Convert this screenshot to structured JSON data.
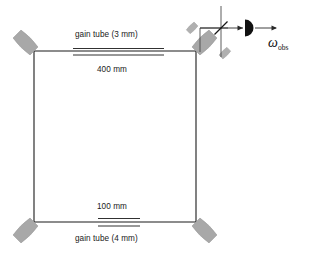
{
  "figure": {
    "type": "ring-laser-gyroscope-schematic",
    "cavity": {
      "shape": "square",
      "top_arm_length": "400 mm",
      "bottom_arm_length": "100 mm"
    },
    "labels": {
      "gain_tube_top": "gain tube (3 mm)",
      "length_top": "400 mm",
      "length_bottom": "100 mm",
      "gain_tube_bottom": "gain tube (4 mm)",
      "omega_symbol": "ω",
      "omega_subscript": "obs"
    },
    "colors": {
      "mirror_fill": "#a8a8a8",
      "mirror_stroke": "#9a9a9a",
      "beam_line": "#1a1a1a",
      "detector_fill": "#111111",
      "background": "#ffffff"
    },
    "components": {
      "mirrors": [
        {
          "name": "mirror-top-left",
          "position": "top-left"
        },
        {
          "name": "mirror-top-right",
          "position": "top-right"
        },
        {
          "name": "mirror-bottom-left",
          "position": "bottom-left"
        },
        {
          "name": "mirror-bottom-right",
          "position": "bottom-right"
        }
      ],
      "gain_tubes": [
        {
          "name": "gain-tube-top",
          "bore": "3 mm",
          "arm": "400 mm"
        },
        {
          "name": "gain-tube-bottom",
          "bore": "4 mm",
          "arm": "100 mm"
        }
      ],
      "detector": {
        "name": "photodetector",
        "output_signal": "ω obs"
      },
      "beamsplitter": {
        "name": "beam-combiner",
        "orientation": "45-degree"
      }
    }
  }
}
